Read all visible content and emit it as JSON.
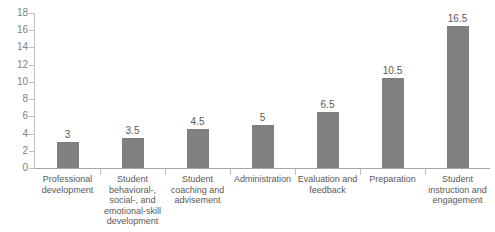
{
  "chart_data": {
    "type": "bar",
    "title": "",
    "subtitle": "",
    "xlabel": "",
    "ylabel": "",
    "ylim": [
      0,
      18
    ],
    "ytick_step": 2,
    "grid": false,
    "legend": false,
    "legend_position": "none",
    "orientation": "vertical",
    "bar_color": "#808080",
    "axis_color": "#bfbfbf",
    "text_color": "#595959",
    "categories": [
      "Professional development",
      "Student behavioral-, social-, and emotional-skill development",
      "Student coaching and advisement",
      "Administration",
      "Evaluation and feedback",
      "Preparation",
      "Student instruction and engagement"
    ],
    "values": [
      3,
      3.5,
      4.5,
      5,
      6.5,
      10.5,
      16.5
    ],
    "value_labels": [
      "3",
      "3.5",
      "4.5",
      "5",
      "6.5",
      "10.5",
      "16.5"
    ],
    "ytick_labels": [
      "18",
      "16",
      "14",
      "12",
      "10",
      "8",
      "6",
      "4",
      "2",
      "0"
    ],
    "ytick_values": [
      18,
      16,
      14,
      12,
      10,
      8,
      6,
      4,
      2,
      0
    ]
  }
}
